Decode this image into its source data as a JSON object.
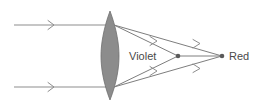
{
  "diagram": {
    "background_color": "#ffffff",
    "labels": {
      "violet": "Violet",
      "red": "Red"
    },
    "colors": {
      "ray": "#8d8d8d",
      "refracted_ray": "#7e7e7e",
      "lens_fill": "#8c8c8c",
      "lens_stroke": "#6e6e6e",
      "focal_dot": "#5a5a5a",
      "text": "#4a4a4a"
    },
    "lens": {
      "name": "converging-biconvex-lens",
      "center_x": 110,
      "top_y": 11,
      "bottom_y": 100,
      "half_width": 9
    },
    "focal_points": [
      {
        "name": "violet-focus",
        "label": "Violet",
        "x": 178,
        "y": 56
      },
      {
        "name": "red-focus",
        "label": "Red",
        "x": 222,
        "y": 56
      }
    ],
    "incoming_rays": [
      {
        "name": "upper-incoming-ray",
        "x1": 14,
        "y1": 25,
        "x2": 110,
        "y2": 25
      },
      {
        "name": "lower-incoming-ray",
        "x1": 14,
        "y1": 87,
        "x2": 110,
        "y2": 87
      }
    ],
    "refracted_rays": [
      {
        "name": "upper-violet-ray",
        "x1": 113,
        "y1": 25,
        "x2": 178,
        "y2": 56
      },
      {
        "name": "lower-violet-ray",
        "x1": 113,
        "y1": 87,
        "x2": 178,
        "y2": 56
      },
      {
        "name": "upper-red-ray",
        "x1": 113,
        "y1": 25,
        "x2": 222,
        "y2": 56
      },
      {
        "name": "lower-red-ray",
        "x1": 113,
        "y1": 87,
        "x2": 222,
        "y2": 56
      },
      {
        "name": "violet-divergent-upper",
        "x1": 178,
        "y1": 56,
        "x2": 222,
        "y2": 56
      }
    ]
  }
}
